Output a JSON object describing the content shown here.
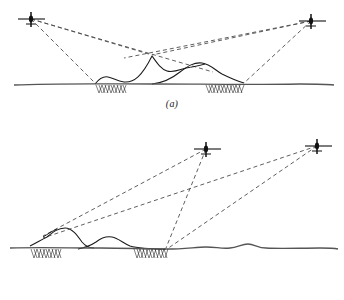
{
  "figure": {
    "background_color": "#ffffff",
    "ink_color": "#1a1a1a",
    "ground_color": "#555555",
    "ray_color": "#4d4d4d",
    "width": 344,
    "height": 300
  },
  "panels": [
    {
      "id": "a",
      "caption": "(a)",
      "description": "Two aircraft at similar high altitudes on opposite sides illuminate a terrain ridge; dashed look-rays graze the peaks and create shadowed (hatched) ground patches.",
      "aircraft": [
        {
          "name": "aircraft-left",
          "label": "",
          "x": 30,
          "y": 18,
          "heading": "right"
        },
        {
          "name": "aircraft-right",
          "label": "",
          "x": 312,
          "y": 20,
          "heading": "left"
        }
      ],
      "ground_line_y": 86,
      "shadow_patches": [
        {
          "name": "shadow-patch-left",
          "x_start": 95,
          "x_end": 127,
          "depth": 9
        },
        {
          "name": "shadow-patch-right",
          "x_start": 205,
          "x_end": 245,
          "depth": 9
        }
      ],
      "rays": [
        {
          "from": "aircraft-left",
          "to": "peak-main",
          "style": "dashed"
        },
        {
          "from": "aircraft-left",
          "to": "ground-left-shadow-start",
          "style": "dashed"
        },
        {
          "from": "aircraft-left",
          "to": "far-right-overshoot",
          "style": "dashed"
        },
        {
          "from": "aircraft-right",
          "to": "peak-main",
          "style": "dashed"
        },
        {
          "from": "aircraft-right",
          "to": "ground-right-shadow-end",
          "style": "dashed"
        },
        {
          "from": "aircraft-right",
          "to": "far-left-overshoot",
          "style": "dashed"
        }
      ]
    },
    {
      "id": "b",
      "caption": "(b)",
      "description": "Both aircraft are positioned to the right at moderate altitude; long low-grazing dashed rays reach across to the left ridge, producing longer shadow regions.",
      "aircraft": [
        {
          "name": "aircraft-inner",
          "label": "",
          "x": 206,
          "y": 30,
          "heading": "left"
        },
        {
          "name": "aircraft-outer",
          "label": "",
          "x": 318,
          "y": 27,
          "heading": "left"
        }
      ],
      "ground_line_y": 132,
      "shadow_patches": [
        {
          "name": "shadow-patch-left",
          "x_start": 30,
          "x_end": 62,
          "depth": 9
        },
        {
          "name": "shadow-patch-right",
          "x_start": 133,
          "x_end": 168,
          "depth": 9
        }
      ],
      "rays": [
        {
          "from": "aircraft-inner",
          "to": "left-ridge-crest",
          "style": "dashed"
        },
        {
          "from": "aircraft-inner",
          "to": "right-shadow-edge",
          "style": "dashed"
        },
        {
          "from": "aircraft-outer",
          "to": "left-ridge-crest",
          "style": "dashed"
        },
        {
          "from": "aircraft-outer",
          "to": "right-shadow-edge",
          "style": "dashed"
        }
      ]
    }
  ],
  "icons": {
    "aircraft": "aircraft-plan-symbol",
    "hatching": "shadow-hatch-pattern"
  }
}
